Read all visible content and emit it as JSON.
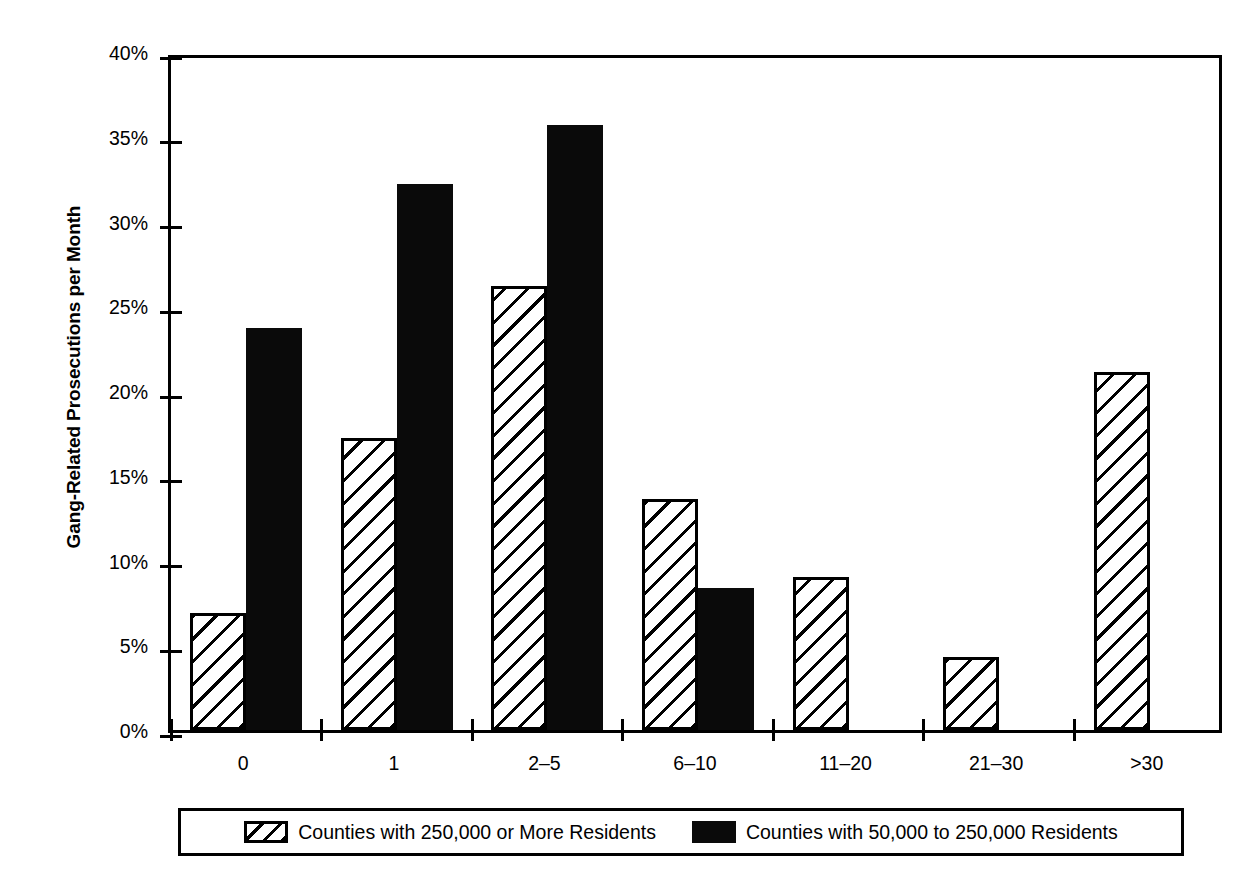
{
  "chart_data": {
    "type": "bar",
    "title": "",
    "xlabel": "",
    "ylabel": "Gang-Related Prosecutions per Month",
    "ylim": [
      0,
      40
    ],
    "ytick_labels": [
      "0%",
      "5%",
      "10%",
      "15%",
      "20%",
      "25%",
      "30%",
      "35%",
      "40%"
    ],
    "ytick_values": [
      0,
      5,
      10,
      15,
      20,
      25,
      30,
      35,
      40
    ],
    "grid": false,
    "legend_position": "bottom",
    "categories": [
      "0",
      "1",
      "2–5",
      "6–10",
      "11–20",
      "21–30",
      ">30"
    ],
    "series": [
      {
        "name": "Counties with 250,000 or More Residents",
        "fill": "diagonal-hatch",
        "values": [
          6.9,
          17.2,
          26.2,
          13.6,
          9.0,
          4.3,
          21.1
        ]
      },
      {
        "name": "Counties with 50,000 to 250,000 Residents",
        "fill": "solid-black",
        "values": [
          23.7,
          32.2,
          35.7,
          8.4,
          0,
          0,
          0
        ]
      }
    ]
  },
  "colors": {
    "foreground": "#000000",
    "background": "#ffffff",
    "solid_series": "#0a0a0a"
  },
  "legend": {
    "items": [
      {
        "label": "Counties with 250,000 or More Residents",
        "swatch": "diagonal-hatch-swatch"
      },
      {
        "label": "Counties with 50,000 to 250,000 Residents",
        "swatch": "solid-black-swatch"
      }
    ]
  }
}
